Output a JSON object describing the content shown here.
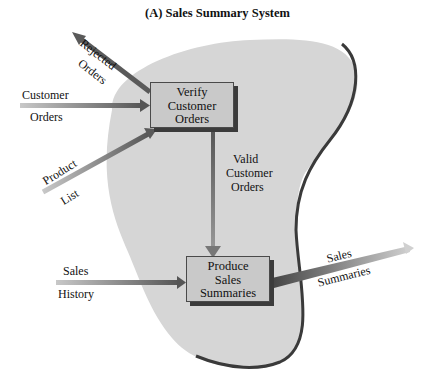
{
  "title": "(A) Sales Summary System",
  "colors": {
    "boundary_fill": "#d6d6d6",
    "boundary_stroke": "#3a3a3a",
    "process_fill": "#c9c9c9",
    "arrow_dark": "#555555",
    "arrow_light": "#bfbfbf"
  },
  "processes": [
    {
      "id": "verify",
      "lines": [
        "Verify",
        "Customer",
        "Orders"
      ]
    },
    {
      "id": "produce",
      "lines": [
        "Produce",
        "Sales",
        "Summaries"
      ]
    }
  ],
  "flows": {
    "rejected_orders": {
      "line1": "Rejected",
      "line2": "Orders",
      "from": "Verify Customer Orders",
      "to": "external"
    },
    "customer_orders": {
      "line1": "Customer",
      "line2": "Orders",
      "from": "external",
      "to": "Verify Customer Orders"
    },
    "product_list": {
      "line1": "Product",
      "line2": "List",
      "from": "external",
      "to": "Verify Customer Orders"
    },
    "valid_customer_orders": {
      "line1": "Valid",
      "line2": "Customer",
      "line3": "Orders",
      "from": "Verify Customer Orders",
      "to": "Produce Sales Summaries"
    },
    "sales_history": {
      "line1": "Sales",
      "line2": "History",
      "from": "external",
      "to": "Produce Sales Summaries"
    },
    "sales_summaries": {
      "line1": "Sales",
      "line2": "Summaries",
      "from": "Produce Sales Summaries",
      "to": "external"
    }
  }
}
